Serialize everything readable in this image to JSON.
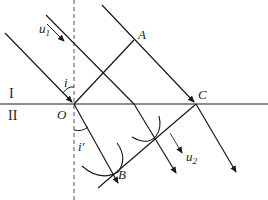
{
  "diagram": {
    "labels": {
      "A": "A",
      "C": "C",
      "O": "O",
      "B": "B",
      "i": "i",
      "i_prime": "i′",
      "medium1": "I",
      "medium2": "II",
      "u1_base": "u",
      "u1_sub": "1",
      "u2_base": "u",
      "u2_sub": "2"
    },
    "colors": {
      "line": "#1a1a1a",
      "dashed": "#555555",
      "background": "#ffffff"
    },
    "points": {
      "O": [
        74,
        104
      ],
      "A": [
        134,
        40
      ],
      "C": [
        196,
        104
      ],
      "B": [
        113,
        175
      ]
    }
  }
}
